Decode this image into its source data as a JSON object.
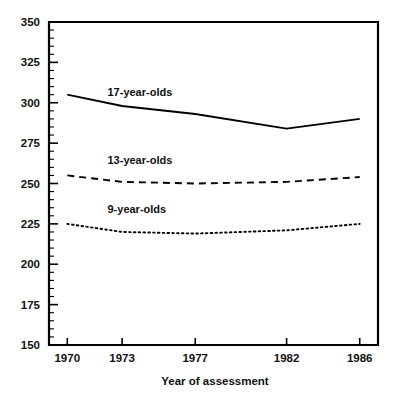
{
  "chart_data": {
    "type": "line",
    "title": "",
    "subtitle": "",
    "xlabel": "Year of assessment",
    "ylabel": "",
    "x": [
      1970,
      1973,
      1977,
      1982,
      1986
    ],
    "categories": [
      "1970",
      "1973",
      "1977",
      "1982",
      "1986"
    ],
    "xlim": [
      1969,
      1987
    ],
    "ylim": [
      150,
      350
    ],
    "y_major_step": 25,
    "y_minor_step": 5,
    "grid": false,
    "legend_position": "inline-labels",
    "series": [
      {
        "name": "17-year-olds",
        "style": "solid",
        "values": [
          305,
          298,
          293,
          284,
          290
        ],
        "label_x": 1972.2,
        "label_y": 304
      },
      {
        "name": "13-year-olds",
        "style": "dashed",
        "values": [
          255,
          251,
          250,
          251,
          254
        ],
        "label_x": 1972.2,
        "label_y": 262
      },
      {
        "name": "9-year-olds",
        "style": "dotted",
        "values": [
          225,
          220,
          219,
          221,
          225
        ],
        "label_x": 1972.2,
        "label_y": 232
      }
    ]
  },
  "axes": {
    "y_tick_labels": [
      "350",
      "325",
      "300",
      "275",
      "250",
      "225",
      "200",
      "175",
      "150"
    ],
    "y_tick_values": [
      350,
      325,
      300,
      275,
      250,
      225,
      200,
      175,
      150
    ],
    "x_tick_labels": [
      "1970",
      "1973",
      "1977",
      "1982",
      "1986"
    ],
    "x_tick_values": [
      1970,
      1973,
      1977,
      1982,
      1986
    ],
    "x_axis_title": "Year of assessment"
  },
  "series_labels": {
    "s17": "17-year-olds",
    "s13": "13-year-olds",
    "s9": "9-year-olds"
  },
  "colors": {
    "ink": "#000000",
    "background": "#ffffff"
  }
}
